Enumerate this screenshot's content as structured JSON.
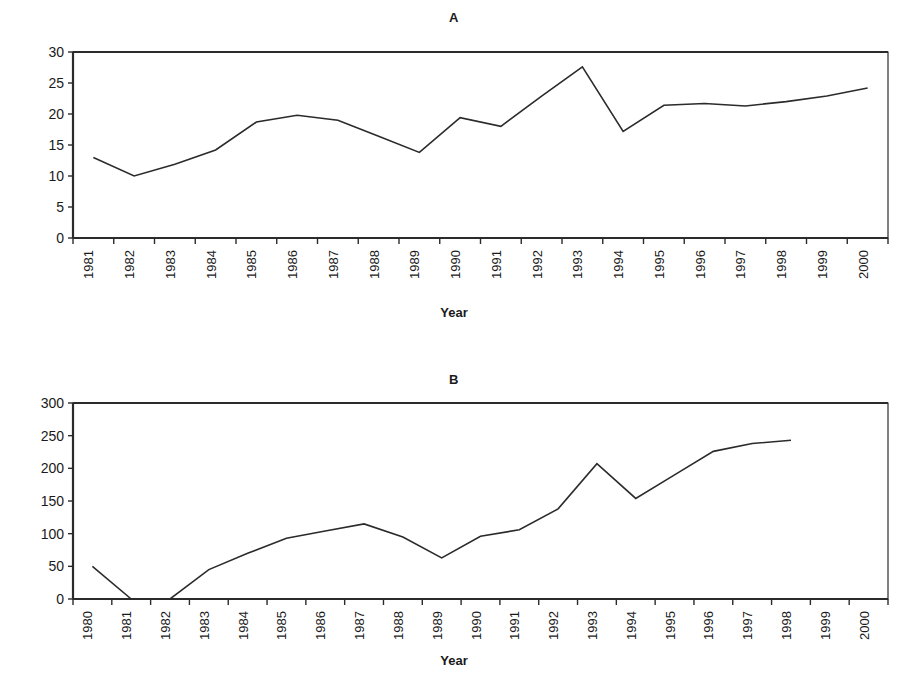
{
  "figure": {
    "axis_title": "Year",
    "line_color": "#2b2b2b",
    "axis_color": "#2b2b2b",
    "background": "#ffffff"
  },
  "chart_data": [
    {
      "type": "line",
      "title": "A",
      "xlabel": "Year",
      "ylabel": "",
      "ylim": [
        0,
        30
      ],
      "ytick_values": [
        0,
        5,
        10,
        15,
        20,
        25,
        30
      ],
      "ytick_labels": [
        "0",
        "5",
        "10",
        "15",
        "20",
        "25",
        "30"
      ],
      "grid": false,
      "legend": "none",
      "categories": [
        "1981",
        "1982",
        "1983",
        "1984",
        "1985",
        "1986",
        "1987",
        "1988",
        "1989",
        "1990",
        "1991",
        "1992",
        "1993",
        "1994",
        "1995",
        "1996",
        "1997",
        "1998",
        "1999",
        "2000"
      ],
      "values": [
        13.0,
        10.0,
        11.9,
        14.2,
        18.7,
        19.8,
        19.0,
        16.4,
        13.8,
        19.4,
        18.0,
        22.9,
        27.6,
        17.2,
        21.4,
        21.7,
        21.3,
        22.0,
        22.9,
        24.2
      ]
    },
    {
      "type": "line",
      "title": "B",
      "xlabel": "Year",
      "ylabel": "",
      "ylim": [
        0,
        300
      ],
      "ytick_values": [
        0,
        50,
        100,
        150,
        200,
        250,
        300
      ],
      "ytick_labels": [
        "0",
        "50",
        "100",
        "150",
        "200",
        "250",
        "300"
      ],
      "grid": false,
      "legend": "none",
      "categories": [
        "1980",
        "1981",
        "1982",
        "1983",
        "1984",
        "1985",
        "1986",
        "1987",
        "1988",
        "1989",
        "1990",
        "1991",
        "1992",
        "1993",
        "1994",
        "1995",
        "1996",
        "1997",
        "1998",
        "1999",
        "2000"
      ],
      "values": [
        50,
        0,
        0,
        45,
        70,
        93,
        104,
        115,
        95,
        63,
        96,
        106,
        138,
        207,
        154,
        190,
        226,
        238,
        243,
        null,
        null
      ]
    }
  ]
}
